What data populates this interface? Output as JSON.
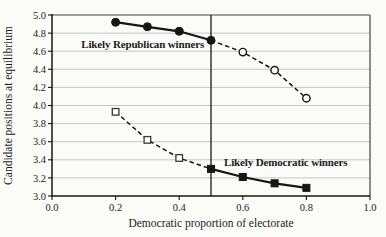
{
  "figure": {
    "background": "#fbfbf8",
    "ink_color": "#161616",
    "grid_color": "#c7c7c7",
    "border_color": "#6f6f6f"
  },
  "chart_data": {
    "type": "line",
    "title": "",
    "xlabel": "Democratic proportion of electorate",
    "ylabel": "Candidate positions at equilibrium",
    "xlim": [
      0.0,
      1.0
    ],
    "ylim": [
      3.0,
      5.0
    ],
    "grid": "horizontal",
    "legend_position": "none",
    "x_ticks": {
      "values": [
        0.0,
        0.2,
        0.4,
        0.6,
        0.8,
        1.0
      ],
      "labels": [
        "0.0",
        "0.2",
        "0.4",
        "0.6",
        "0.8",
        "1.0"
      ]
    },
    "y_ticks": {
      "values": [
        3.0,
        3.2,
        3.4,
        3.6,
        3.8,
        4.0,
        4.2,
        4.4,
        4.6,
        4.8,
        5.0
      ],
      "labels": [
        "3.0",
        "3.2",
        "3.4",
        "3.6",
        "3.8",
        "4.0",
        "4.2",
        "4.4",
        "4.6",
        "4.8",
        "5.0"
      ]
    },
    "reference_line": {
      "axis": "x",
      "value": 0.5
    },
    "x": [
      0.2,
      0.3,
      0.4,
      0.5,
      0.6,
      0.7,
      0.8
    ],
    "series": [
      {
        "name": "Republican candidate position",
        "marker": "circle",
        "values": [
          4.92,
          4.87,
          4.82,
          4.72,
          4.59,
          4.39,
          4.08
        ],
        "segments": [
          {
            "x_from": 0.2,
            "x_to": 0.5,
            "style": "solid"
          },
          {
            "x_from": 0.5,
            "x_to": 0.8,
            "style": "dashed"
          }
        ],
        "filled_markers": [
          0.2,
          0.3,
          0.4,
          0.5
        ],
        "open_markers": [
          0.6,
          0.7,
          0.8
        ]
      },
      {
        "name": "Democratic candidate position",
        "marker": "square",
        "values": [
          3.93,
          3.62,
          3.42,
          3.3,
          3.21,
          3.14,
          3.09
        ],
        "segments": [
          {
            "x_from": 0.2,
            "x_to": 0.5,
            "style": "dashed"
          },
          {
            "x_from": 0.5,
            "x_to": 0.8,
            "style": "solid"
          }
        ],
        "filled_markers": [
          0.5,
          0.6,
          0.7,
          0.8
        ],
        "open_markers": [
          0.2,
          0.3,
          0.4
        ]
      }
    ],
    "annotations": [
      {
        "text": "Likely Republican winners",
        "x": 0.092,
        "y": 4.64,
        "anchor": "start"
      },
      {
        "text": "Likely Democratic winners",
        "x": 0.541,
        "y": 3.33,
        "anchor": "start"
      }
    ]
  }
}
